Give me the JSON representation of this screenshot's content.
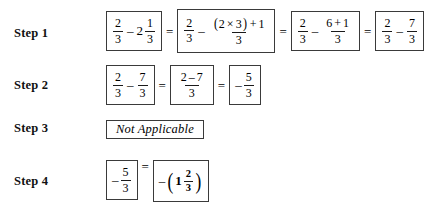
{
  "document": {
    "title": "Mixed number subtraction worked steps",
    "background_color": "#ffffff",
    "text_color": "#000000",
    "box_border_color": "#3a3a3a"
  },
  "steps": [
    {
      "label": "Step 1",
      "expressions": [
        {
          "type": "fraction-difference",
          "left_numerator": "2",
          "left_denominator": "3",
          "operator": "–",
          "whole": "2",
          "right_numerator": "1",
          "right_denominator": "3"
        },
        {
          "type": "fraction-difference",
          "left_numerator": "2",
          "left_denominator": "3",
          "operator": "–",
          "right_numerator_open_paren": "(",
          "right_numerator_a": "2",
          "times": "×",
          "right_numerator_b": "3",
          "right_numerator_close_paren": ")",
          "right_numerator_plus": "+",
          "right_numerator_c": "1",
          "right_denominator": "3"
        },
        {
          "type": "fraction-difference",
          "left_numerator": "2",
          "left_denominator": "3",
          "operator": "–",
          "right_numerator_a": "6",
          "right_numerator_plus": "+",
          "right_numerator_b": "1",
          "right_denominator": "3"
        },
        {
          "type": "fraction-difference",
          "left_numerator": "2",
          "left_denominator": "3",
          "operator": "–",
          "right_numerator": "7",
          "right_denominator": "3"
        }
      ],
      "equals": [
        "=",
        "=",
        "="
      ]
    },
    {
      "label": "Step 2",
      "expressions": [
        {
          "type": "fraction-difference",
          "left_numerator": "2",
          "left_denominator": "3",
          "operator": "–",
          "right_numerator": "7",
          "right_denominator": "3"
        },
        {
          "type": "single-fraction",
          "numerator_a": "2",
          "numerator_minus": "–",
          "numerator_b": "7",
          "denominator": "3"
        },
        {
          "type": "negative-fraction",
          "sign": "–",
          "numerator": "5",
          "denominator": "3"
        }
      ],
      "equals": [
        "=",
        "="
      ]
    },
    {
      "label": "Step 3",
      "expressions": [
        {
          "type": "text",
          "value": "Not Applicable"
        }
      ],
      "equals": []
    },
    {
      "label": "Step 4",
      "expressions": [
        {
          "type": "negative-fraction",
          "sign": "–",
          "numerator": "5",
          "denominator": "3"
        },
        {
          "type": "negated-mixed-number",
          "sign": "–",
          "open_paren": "(",
          "whole": "1",
          "numerator": "2",
          "denominator": "3",
          "close_paren": ")"
        }
      ],
      "equals": [
        "="
      ]
    }
  ]
}
